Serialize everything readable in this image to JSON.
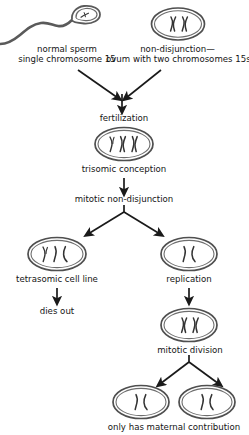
{
  "figure": {
    "background_color": "#ffffff",
    "ink_color": "#1a1a1a",
    "cell_outline_color": "#555555",
    "chromosome_color": "#3a3a3a"
  },
  "labels": {
    "sperm_line1": "normal sperm",
    "sperm_line2": "single chromosome 15",
    "ovum_line1": "non-disjunction—",
    "ovum_line2": "ovum with two chromosomes 15s",
    "fertilization": "fertilization",
    "trisomic_conception": "trisomic conception",
    "mitotic_nondisjunction": "mitotic non-disjunction",
    "tetrasomic": "tetrasomic cell line",
    "dies_out": "dies out",
    "replication": "replication",
    "mitotic_division": "mitotic division",
    "maternal_contribution": "only has maternal contribution"
  },
  "cells": [
    {
      "name": "sperm-cell",
      "chromosome_count": 1,
      "chromosome_type": "single-strand",
      "shape": "sperm-with-tail"
    },
    {
      "name": "ovum-cell",
      "chromosome_count": 2,
      "chromosome_type": "x-shaped",
      "shape": "oval"
    },
    {
      "name": "trisomic-zygote-cell",
      "chromosome_count": 3,
      "chromosome_type": "mixed",
      "shape": "oval"
    },
    {
      "name": "tetrasomic-cell",
      "chromosome_count": 3,
      "chromosome_type": "mixed",
      "shape": "oval"
    },
    {
      "name": "replication-cell",
      "chromosome_count": 2,
      "chromosome_type": "single-strand",
      "shape": "oval"
    },
    {
      "name": "mitotic-division-cell",
      "chromosome_count": 2,
      "chromosome_type": "x-shaped",
      "shape": "oval"
    },
    {
      "name": "daughter-cell-left",
      "chromosome_count": 2,
      "chromosome_type": "single-strand",
      "shape": "oval"
    },
    {
      "name": "daughter-cell-right",
      "chromosome_count": 2,
      "chromosome_type": "single-strand",
      "shape": "oval"
    }
  ],
  "arrows": [
    {
      "name": "sperm-to-fertilization",
      "direction": "diagonal-down-right"
    },
    {
      "name": "ovum-to-fertilization",
      "direction": "diagonal-down-left"
    },
    {
      "name": "fertilization-down",
      "direction": "down"
    },
    {
      "name": "zygote-to-mitotic-nondisjunction",
      "direction": "down"
    },
    {
      "name": "split-to-tetrasomic",
      "direction": "diagonal-down-left"
    },
    {
      "name": "split-to-replication",
      "direction": "diagonal-down-right"
    },
    {
      "name": "tetrasomic-to-dies-out",
      "direction": "down"
    },
    {
      "name": "replication-to-mitotic-division",
      "direction": "down"
    },
    {
      "name": "division-to-daughter-left",
      "direction": "diagonal-down-left"
    },
    {
      "name": "division-to-daughter-right",
      "direction": "diagonal-down-right"
    }
  ]
}
